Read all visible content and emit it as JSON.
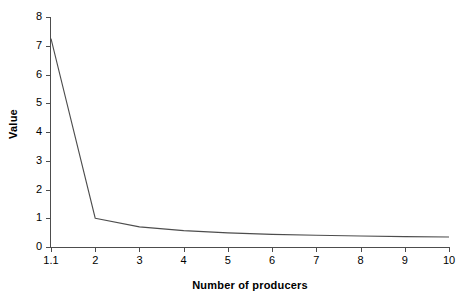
{
  "chart_data": {
    "type": "line",
    "title": "",
    "xlabel": "Number of producers",
    "ylabel": "Value",
    "categories": [
      "1.1",
      "2",
      "3",
      "4",
      "5",
      "6",
      "7",
      "8",
      "9",
      "10"
    ],
    "values": [
      7.25,
      1.0,
      0.7,
      0.57,
      0.49,
      0.44,
      0.41,
      0.38,
      0.36,
      0.35
    ],
    "series": [
      {
        "name": "Value",
        "values": [
          7.25,
          1.0,
          0.7,
          0.57,
          0.49,
          0.44,
          0.41,
          0.38,
          0.36,
          0.35
        ]
      }
    ],
    "ylim": [
      0,
      8
    ],
    "yticks": [
      0,
      1,
      2,
      3,
      4,
      5,
      6,
      7,
      8
    ],
    "ytick_labels": [
      "0",
      "1",
      "2",
      "3",
      "4",
      "5",
      "6",
      "7",
      "8"
    ],
    "xtick_labels": [
      "1.1",
      "2",
      "3",
      "4",
      "5",
      "6",
      "7",
      "8",
      "9",
      "10"
    ],
    "grid": false,
    "legend": false,
    "legend_position": "none",
    "line_color": "#4d4d4d",
    "background_color": "#ffffff",
    "axis_color": "#4d4d4d"
  }
}
